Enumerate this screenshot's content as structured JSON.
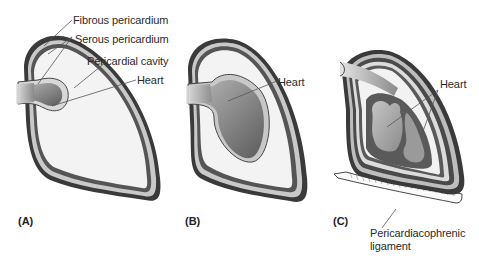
{
  "figure": {
    "panels": [
      {
        "id": "A",
        "label": "(A)"
      },
      {
        "id": "B",
        "label": "(B)"
      },
      {
        "id": "C",
        "label": "(C)"
      }
    ],
    "labels": {
      "fibrous_pericardium": "Fibrous pericardium",
      "serous_pericardium": "Serous pericardium",
      "pericardial_cavity": "Pericardial cavity",
      "heart_a": "Heart",
      "heart_b": "Heart",
      "heart_c": "Heart",
      "ligament_line1": "Pericardiacophrenic",
      "ligament_line2": "ligament"
    },
    "colors": {
      "fibrous_layer": "#3a3a3a",
      "serous_layer": "#d6d6d6",
      "cavity": "#f4f4f4",
      "heart_dark": "#6a6a6a",
      "heart_light": "#b4b4b4",
      "leader_line": "#555555"
    }
  }
}
